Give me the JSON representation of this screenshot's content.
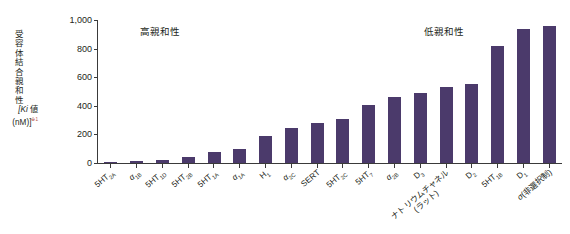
{
  "chart_data": {
    "type": "bar",
    "title": "",
    "xlabel": "",
    "ylabel_lines": [
      "受",
      "容",
      "体",
      "結",
      "合",
      "親",
      "和",
      "性"
    ],
    "ylabel_unit_line1": "[Ki 値",
    "ylabel_unit_line2": "(nM)]",
    "ylabel_unit_ref": "※1",
    "ylim": [
      0,
      1000
    ],
    "yticks": [
      "0",
      "200",
      "400",
      "600",
      "800",
      "1,000"
    ],
    "ytick_values": [
      0,
      200,
      400,
      600,
      800,
      1000
    ],
    "grid": false,
    "legend": "none",
    "bar_color": "#4b3a6b",
    "axis_color": "#3a3a3a",
    "annotations": [
      {
        "text": "高親和性",
        "position": "left"
      },
      {
        "text": "低親和性",
        "position": "right"
      }
    ],
    "categories": [
      "5HT2A",
      "α1B",
      "5HT1D",
      "5HT2B",
      "5HT1A",
      "α1A",
      "H1",
      "α2C",
      "SERT",
      "5HT2C",
      "5HT7",
      "α2B",
      "D3",
      "ナトリウムチャネル(ラット)",
      "D2",
      "5HT1B",
      "D1",
      "σ(非選択制)"
    ],
    "values": [
      5,
      12,
      18,
      45,
      80,
      95,
      190,
      245,
      280,
      305,
      405,
      465,
      490,
      535,
      555,
      820,
      940,
      955
    ],
    "category_labels": [
      {
        "main": "5HT",
        "sub": "2A",
        "greek": "",
        "line2": ""
      },
      {
        "main": "",
        "sub": "1B",
        "greek": "α",
        "line2": ""
      },
      {
        "main": "5HT",
        "sub": "1D",
        "greek": "",
        "line2": ""
      },
      {
        "main": "5HT",
        "sub": "2B",
        "greek": "",
        "line2": ""
      },
      {
        "main": "5HT",
        "sub": "1A",
        "greek": "",
        "line2": ""
      },
      {
        "main": "",
        "sub": "1A",
        "greek": "α",
        "line2": ""
      },
      {
        "main": "H",
        "sub": "1",
        "greek": "",
        "line2": ""
      },
      {
        "main": "",
        "sub": "2C",
        "greek": "α",
        "line2": ""
      },
      {
        "main": "SERT",
        "sub": "",
        "greek": "",
        "line2": ""
      },
      {
        "main": "5HT",
        "sub": "2C",
        "greek": "",
        "line2": ""
      },
      {
        "main": "5HT",
        "sub": "7",
        "greek": "",
        "line2": ""
      },
      {
        "main": "",
        "sub": "2B",
        "greek": "α",
        "line2": ""
      },
      {
        "main": "D",
        "sub": "3",
        "greek": "",
        "line2": ""
      },
      {
        "main": "ナトリウムチャネル",
        "sub": "",
        "greek": "",
        "line2": "(ラット)"
      },
      {
        "main": "D",
        "sub": "2",
        "greek": "",
        "line2": ""
      },
      {
        "main": "5HT",
        "sub": "1B",
        "greek": "",
        "line2": ""
      },
      {
        "main": "D",
        "sub": "1",
        "greek": "",
        "line2": ""
      },
      {
        "main": "(非選択制)",
        "sub": "",
        "greek": "σ",
        "line2": ""
      }
    ]
  }
}
